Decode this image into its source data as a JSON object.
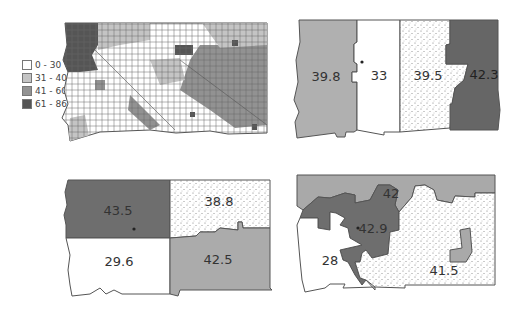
{
  "colors": {
    "c0_30": "#ffffff",
    "c31_40": "#b7b7b7",
    "c41_60": "#8f8f8f",
    "c61_86": "#555555",
    "dark_district": "#6e6e6e",
    "mid_district": "#a9a9a9",
    "outline": "#555555"
  },
  "legend": {
    "items": [
      {
        "label": "0 - 30"
      },
      {
        "label": "31 - 40"
      },
      {
        "label": "41 - 60"
      },
      {
        "label": "61 - 86"
      }
    ]
  },
  "maps": {
    "choropleth": {
      "title": ""
    },
    "plan_vertical": {
      "districts": [
        {
          "label": "39.8",
          "fill": "medium"
        },
        {
          "label": "33",
          "fill": "white"
        },
        {
          "label": "39.5",
          "fill": "stipple"
        },
        {
          "label": "42.3",
          "fill": "dark"
        }
      ]
    },
    "plan_quadrants": {
      "districts": [
        {
          "label": "43.5",
          "fill": "dark"
        },
        {
          "label": "38.8",
          "fill": "stipple"
        },
        {
          "label": "29.6",
          "fill": "white"
        },
        {
          "label": "42.5",
          "fill": "medium"
        }
      ]
    },
    "plan_irregular": {
      "districts": [
        {
          "label": "42",
          "fill": "medium"
        },
        {
          "label": "42.9",
          "fill": "dark"
        },
        {
          "label": "28",
          "fill": "white"
        },
        {
          "label": "41.5",
          "fill": "stipple"
        }
      ]
    }
  }
}
